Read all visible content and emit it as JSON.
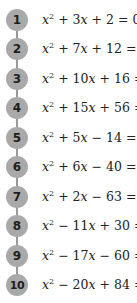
{
  "items": [
    {
      "number": "1",
      "a": "3",
      "op1": "+",
      "b": "2",
      "op2": "+",
      "display": "x² + 3x + 2 = 0"
    },
    {
      "number": "2",
      "a": "7",
      "op1": "+",
      "b": "12",
      "op2": "+",
      "display": "x² + 7x + 12 = 0"
    },
    {
      "number": "3",
      "a": "10",
      "op1": "+",
      "b": "16",
      "op2": "+",
      "display": "x² + 10x + 16 = 0"
    },
    {
      "number": "4",
      "a": "15",
      "op1": "+",
      "b": "56",
      "op2": "+",
      "display": "x² + 15x + 56 = 0"
    },
    {
      "number": "5",
      "a": "5",
      "op1": "+",
      "b": "14",
      "op2": "−",
      "display": "x² + 5x − 14 = 0"
    },
    {
      "number": "6",
      "a": "6",
      "op1": "+",
      "b": "40",
      "op2": "−",
      "display": "x² + 6x − 40 = 0"
    },
    {
      "number": "7",
      "a": "2",
      "op1": "+",
      "b": "63",
      "op2": "−",
      "display": "x² + 2x − 63 = 0"
    },
    {
      "number": "8",
      "a": "11",
      "op1": "−",
      "b": "30",
      "op2": "+",
      "display": "x² − 11x + 30 = 0"
    },
    {
      "number": "9",
      "a": "17",
      "op1": "−",
      "b": "60",
      "op2": "−",
      "display": "x² − 17x − 60 = 0"
    },
    {
      "number": "10",
      "a": "20",
      "op1": "−",
      "b": "84",
      "op2": "+",
      "display": "x² − 20x + 84 = 0"
    }
  ],
  "symbols": {
    "var": "x",
    "exp": "2",
    "equals": "= 0"
  },
  "colors": {
    "circle": "#a9a9a9",
    "number": "#1e1e1e",
    "text": "#222222",
    "connector": "#9a9a9a"
  }
}
